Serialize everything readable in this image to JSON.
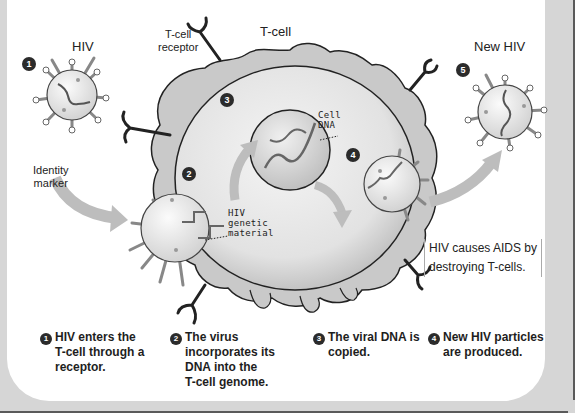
{
  "labels": {
    "hiv": "HIV",
    "tcell_receptor_line1": "T-cell",
    "tcell_receptor_line2": "receptor",
    "tcell": "T-cell",
    "new_hiv": "New HIV",
    "identity_marker_line1": "Identity",
    "identity_marker_line2": "marker",
    "cell_dna_line1": "Cell",
    "cell_dna_line2": "DNA",
    "hiv_genetic_line1": "HIV",
    "hiv_genetic_line2": "genetic",
    "hiv_genetic_line3": "material"
  },
  "badges": [
    "1",
    "2",
    "3",
    "4",
    "5"
  ],
  "note": {
    "line1": "HIV causes AIDS by",
    "line2": "destroying T-cells."
  },
  "captions": [
    {
      "num": "1",
      "lines": [
        "HIV enters the",
        "T-cell through a",
        "receptor."
      ]
    },
    {
      "num": "2",
      "lines": [
        "The virus",
        "incorporates its",
        "DNA into the",
        "T-cell genome."
      ]
    },
    {
      "num": "3",
      "lines": [
        "The viral DNA is",
        "copied."
      ]
    },
    {
      "num": "4",
      "lines": [
        "New HIV particles",
        "are produced."
      ]
    }
  ],
  "colors": {
    "frame": "#d6d6d6",
    "panel": "#ffffff",
    "cell_fill": "#e4e4e4",
    "cell_outline": "#222222",
    "arrow": "#bdbdbd",
    "badge": "#2b2b2b"
  }
}
